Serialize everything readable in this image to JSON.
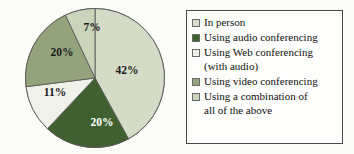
{
  "chart_data": {
    "type": "pie",
    "title": "",
    "subtitle": "",
    "xlabel": "",
    "ylabel": "",
    "grid": false,
    "legend_position": "right",
    "start_angle_deg": 0,
    "direction": "clockwise",
    "categories": [
      "In person",
      "Using audio conferencing",
      "Using Web conferencing (with audio)",
      "Using video conferencing",
      "Using a combination of all of the above"
    ],
    "values": [
      42,
      20,
      11,
      20,
      7
    ],
    "value_labels": [
      "42%",
      "20%",
      "11%",
      "20%",
      "7%"
    ],
    "colors": [
      "#d4dcc8",
      "#40612f",
      "#f0f2ea",
      "#93a47c",
      "#c9d4bb"
    ],
    "slices": [
      {
        "label": "42%",
        "value": 42,
        "color": "#d4dcc8",
        "category": "In person"
      },
      {
        "label": "20%",
        "value": 20,
        "color": "#40612f",
        "category": "Using audio conferencing"
      },
      {
        "label": "11%",
        "value": 11,
        "color": "#f0f2ea",
        "category": "Using Web conferencing (with audio)"
      },
      {
        "label": "20%",
        "value": 20,
        "color": "#93a47c",
        "category": "Using video conferencing"
      },
      {
        "label": "7%",
        "value": 7,
        "color": "#c9d4bb",
        "category": "Using a combination of all of the above"
      }
    ]
  },
  "pie": {
    "labels": {
      "s42": "42%",
      "s20a": "20%",
      "s11": "11%",
      "s20b": "20%",
      "s7": "7%"
    }
  },
  "legend": {
    "items": [
      {
        "swatch": "#d4dcc8",
        "label": "In person"
      },
      {
        "swatch": "#40612f",
        "label": "Using audio conferencing"
      },
      {
        "swatch": "#f0f2ea",
        "label": "Using Web conferencing\n(with audio)"
      },
      {
        "swatch": "#93a47c",
        "label": "Using video conferencing"
      },
      {
        "swatch": "#c9d4bb",
        "label": "Using a combination of\nall of the above"
      }
    ]
  }
}
